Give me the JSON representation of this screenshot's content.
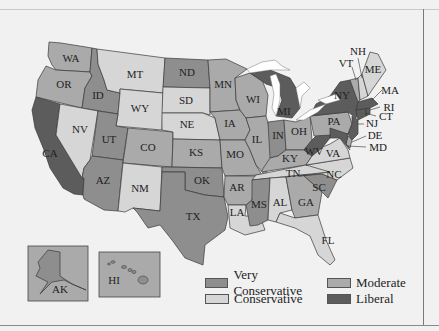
{
  "legend": {
    "items": [
      {
        "key": "very_conservative",
        "label": "Very Conservative",
        "color": "#8e8e8e"
      },
      {
        "key": "moderate",
        "label": "Moderate",
        "color": "#aaaaaa"
      },
      {
        "key": "conservative",
        "label": "Conservative",
        "color": "#d6d6d6"
      },
      {
        "key": "liberal",
        "label": "Liberal",
        "color": "#5c5c5c"
      }
    ]
  },
  "colors": {
    "very_conservative": "#8e8e8e",
    "conservative": "#d6d6d6",
    "moderate": "#aaaaaa",
    "liberal": "#5c5c5c",
    "lakes": "#ffffff",
    "background": "#f1f1f1"
  },
  "states": {
    "WA": "WA",
    "OR": "OR",
    "CA": "CA",
    "ID": "ID",
    "NV": "NV",
    "MT": "MT",
    "WY": "WY",
    "UT": "UT",
    "AZ": "AZ",
    "CO": "CO",
    "NM": "NM",
    "ND": "ND",
    "SD": "SD",
    "NE": "NE",
    "KS": "KS",
    "OK": "OK",
    "TX": "TX",
    "MN": "MN",
    "IA": "IA",
    "MO": "MO",
    "AR": "AR",
    "LA": "LA",
    "WI": "WI",
    "IL": "IL",
    "MI": "MI",
    "IN": "IN",
    "OH": "OH",
    "KY": "KY",
    "TN": "TN",
    "MS": "MS",
    "AL": "AL",
    "GA": "GA",
    "FL": "FL",
    "SC": "SC",
    "NC": "NC",
    "VA": "VA",
    "WV": "WV",
    "PA": "PA",
    "NY": "NY",
    "NJ": "NJ",
    "DE": "DE",
    "MD": "MD",
    "CT": "CT",
    "RI": "RI",
    "MA": "MA",
    "VT": "VT",
    "NH": "NH",
    "ME": "ME",
    "AK": "AK",
    "HI": "HI"
  },
  "state_categories": {
    "WA": "moderate",
    "OR": "moderate",
    "CA": "liberal",
    "ID": "very_conservative",
    "NV": "conservative",
    "MT": "conservative",
    "WY": "conservative",
    "UT": "very_conservative",
    "AZ": "very_conservative",
    "CO": "moderate",
    "NM": "conservative",
    "ND": "very_conservative",
    "SD": "conservative",
    "NE": "conservative",
    "KS": "moderate",
    "OK": "very_conservative",
    "TX": "very_conservative",
    "MN": "moderate",
    "IA": "moderate",
    "MO": "moderate",
    "AR": "moderate",
    "LA": "conservative",
    "WI": "moderate",
    "IL": "moderate",
    "MI": "liberal",
    "IN": "very_conservative",
    "OH": "moderate",
    "KY": "moderate",
    "TN": "conservative",
    "MS": "very_conservative",
    "AL": "conservative",
    "GA": "moderate",
    "FL": "conservative",
    "SC": "very_conservative",
    "NC": "conservative",
    "VA": "conservative",
    "WV": "liberal",
    "PA": "moderate",
    "NY": "liberal",
    "NJ": "liberal",
    "DE": "moderate",
    "MD": "liberal",
    "CT": "liberal",
    "RI": "liberal",
    "MA": "liberal",
    "VT": "moderate",
    "NH": "conservative",
    "ME": "conservative",
    "AK": "very_conservative",
    "HI": "very_conservative"
  }
}
